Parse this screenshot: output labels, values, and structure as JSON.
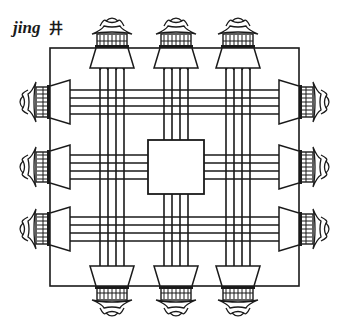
{
  "title": {
    "romanization": "jing",
    "character": "井"
  },
  "diagram": {
    "colors": {
      "ink": "#1a1a1a",
      "paper": "#ffffff"
    },
    "outer_square": {
      "x": 50,
      "y": 48,
      "w": 249,
      "h": 238
    },
    "center_square": {
      "x": 148,
      "y": 140,
      "w": 56,
      "h": 54
    },
    "pavilions": {
      "top": [
        112,
        176,
        238
      ],
      "bottom": [
        112,
        176,
        238
      ],
      "left": [
        102,
        167,
        229
      ],
      "right": [
        102,
        167,
        229
      ]
    }
  }
}
